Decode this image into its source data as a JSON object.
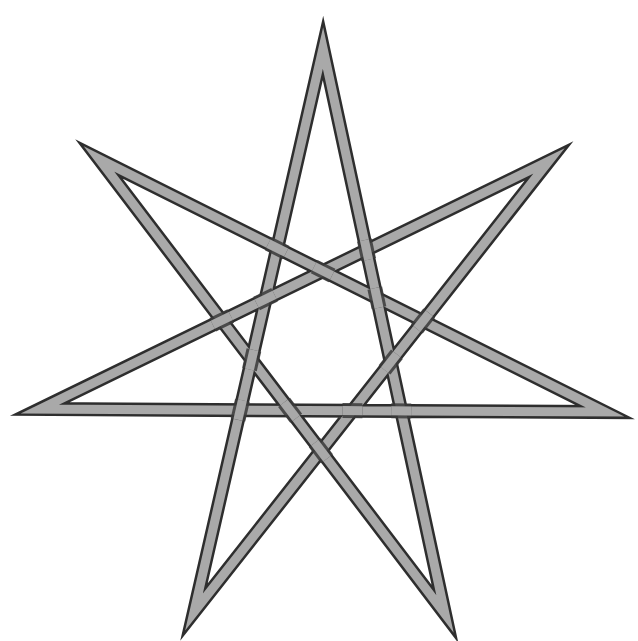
{
  "figure": {
    "type": "heptagram",
    "schlafli": "{7/3}",
    "interlaced": true,
    "vertices": [
      {
        "name": "top",
        "x": 323,
        "y": 48
      },
      {
        "name": "top-right",
        "x": 549,
        "y": 161
      },
      {
        "name": "right",
        "x": 605,
        "y": 412
      },
      {
        "name": "bottom-right",
        "x": 445,
        "y": 614
      },
      {
        "name": "bottom-left",
        "x": 194,
        "y": 612
      },
      {
        "name": "left",
        "x": 40,
        "y": 409
      },
      {
        "name": "top-left",
        "x": 99,
        "y": 159
      }
    ],
    "connection_step": 3,
    "band_width": 11,
    "colors": {
      "background": "#ffffff",
      "band_fill": "#a9a9a9",
      "band_outline": "#2e2e2e",
      "crossing_shadow": "#3a3a3a"
    }
  }
}
